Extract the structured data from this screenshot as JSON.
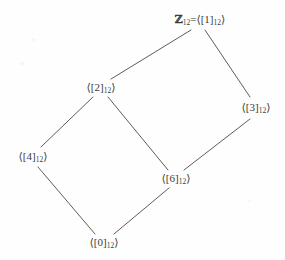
{
  "figure": {
    "kind": "hasse-diagram",
    "width": 285,
    "height": 260,
    "background_color": "#fefefe",
    "line_color": "#4a4a4a",
    "text_color": "#3b3b3b"
  },
  "chart_data": {
    "type": "diagram",
    "title": "",
    "grid": false,
    "legend": null,
    "xlabel": "",
    "ylabel": "",
    "nodes": [
      {
        "id": "top",
        "label": "ℤ₁₂=⟨[1]₁₂⟩",
        "prefix": "ℤ",
        "prefix_sub": "12",
        "equals": "=",
        "generator": "1",
        "modulus": "12",
        "x": 200,
        "y": 20
      },
      {
        "id": "gen2",
        "label": "⟨[2]₁₂⟩",
        "prefix": "",
        "prefix_sub": "",
        "equals": "",
        "generator": "2",
        "modulus": "12",
        "x": 101,
        "y": 88
      },
      {
        "id": "gen3",
        "label": "⟨[3]₁₂⟩",
        "prefix": "",
        "prefix_sub": "",
        "equals": "",
        "generator": "3",
        "modulus": "12",
        "x": 256,
        "y": 108
      },
      {
        "id": "gen4",
        "label": "⟨[4]₁₂⟩",
        "prefix": "",
        "prefix_sub": "",
        "equals": "",
        "generator": "4",
        "modulus": "12",
        "x": 33,
        "y": 157
      },
      {
        "id": "gen6",
        "label": "⟨[6]₁₂⟩",
        "prefix": "",
        "prefix_sub": "",
        "equals": "",
        "generator": "6",
        "modulus": "12",
        "x": 176,
        "y": 179
      },
      {
        "id": "gen0",
        "label": "⟨[0]₁₂⟩",
        "prefix": "",
        "prefix_sub": "",
        "equals": "",
        "generator": "0",
        "modulus": "12",
        "x": 104,
        "y": 243
      }
    ],
    "edges": [
      {
        "from": "top",
        "to": "gen2",
        "x1": 191,
        "y1": 30,
        "x2": 111,
        "y2": 79
      },
      {
        "from": "top",
        "to": "gen3",
        "x1": 205,
        "y1": 30,
        "x2": 250,
        "y2": 97
      },
      {
        "from": "gen2",
        "to": "gen4",
        "x1": 93,
        "y1": 97,
        "x2": 41,
        "y2": 147
      },
      {
        "from": "gen2",
        "to": "gen6",
        "x1": 108,
        "y1": 97,
        "x2": 168,
        "y2": 170
      },
      {
        "from": "gen3",
        "to": "gen6",
        "x1": 250,
        "y1": 119,
        "x2": 184,
        "y2": 170
      },
      {
        "from": "gen4",
        "to": "gen0",
        "x1": 38,
        "y1": 167,
        "x2": 95,
        "y2": 234
      },
      {
        "from": "gen6",
        "to": "gen0",
        "x1": 169,
        "y1": 188,
        "x2": 114,
        "y2": 234
      }
    ],
    "glyphs": {
      "angle_open": "⟨",
      "angle_close": "⟩",
      "bracket_open": "[",
      "bracket_close": "]",
      "integers": "ℤ"
    }
  }
}
